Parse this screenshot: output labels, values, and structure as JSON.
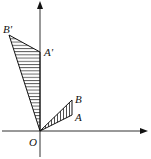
{
  "diagram": {
    "type": "geometric-transformation",
    "axes": {
      "x_axis": {
        "arrow": true
      },
      "y_axis": {
        "arrow": true
      }
    },
    "origin_label": "O",
    "points": {
      "O": {
        "label": "O",
        "x": 40,
        "y": 131
      },
      "A": {
        "label": "A",
        "x": 72,
        "y": 115
      },
      "B": {
        "label": "B",
        "x": 72,
        "y": 100
      },
      "A_prime": {
        "label": "A'",
        "x": 40,
        "y": 52
      },
      "B_prime": {
        "label": "B'",
        "x": 9,
        "y": 35
      }
    },
    "triangles": [
      {
        "name": "OAB",
        "vertices": [
          "O",
          "A",
          "B"
        ],
        "fill": "hatched-vertical"
      },
      {
        "name": "OA'B'",
        "vertices": [
          "O",
          "A'",
          "B'"
        ],
        "fill": "hatched-horizontal"
      }
    ],
    "colors": {
      "stroke": "#111111",
      "background": "#ffffff"
    }
  }
}
